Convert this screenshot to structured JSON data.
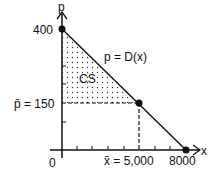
{
  "diagram": {
    "axes": {
      "y_label": "p",
      "x_label": "x",
      "origin_label": "0"
    },
    "labels": {
      "p_intercept": "400",
      "p_bar": "p̄ = 150",
      "x_bar": "x̄ = 5,000",
      "x_intercept": "8000",
      "curve": "p = D(x)",
      "region": "CS"
    },
    "points": [
      {
        "name": "p-intercept",
        "x": 0,
        "p": 400
      },
      {
        "name": "equilibrium",
        "x": 5000,
        "p": 150
      },
      {
        "name": "x-intercept",
        "x": 8000,
        "p": 0
      }
    ],
    "colors": {
      "line": "#111111",
      "dots": "#333333"
    }
  }
}
